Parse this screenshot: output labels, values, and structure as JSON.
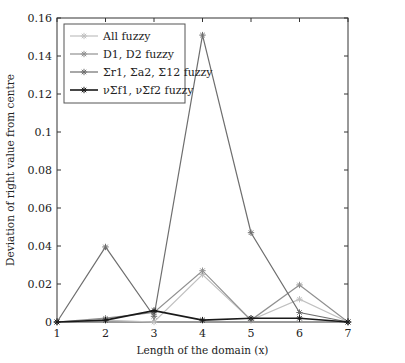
{
  "chart_data": {
    "type": "line",
    "title": "",
    "xlabel": "Length of the domain (x)",
    "ylabel": "Deviation of right value from centre",
    "x": [
      1,
      2,
      3,
      4,
      5,
      6,
      7
    ],
    "xlim": [
      1,
      7
    ],
    "ylim": [
      0,
      0.16
    ],
    "xticks": [
      "1",
      "2",
      "3",
      "4",
      "5",
      "6",
      "7"
    ],
    "yticks": [
      "0",
      "0.02",
      "0.04",
      "0.06",
      "0.08",
      "0.1",
      "0.12",
      "0.14",
      "0.16"
    ],
    "grid": false,
    "legend_position": "upper left",
    "series": [
      {
        "name": "All fuzzy",
        "color": "#c0c0c0",
        "values": [
          0,
          0.001,
          0.0,
          0.025,
          0.001,
          0.012,
          0.0
        ]
      },
      {
        "name": "D1, D2 fuzzy",
        "color": "#909090",
        "values": [
          0,
          0.002,
          0.005,
          0.027,
          0.001,
          0.0195,
          0.0
        ]
      },
      {
        "name": "Σr1, Σa2, Σ12 fuzzy",
        "color": "#6e6e6e",
        "values": [
          0,
          0.0395,
          0.003,
          0.151,
          0.047,
          0.005,
          0.0
        ]
      },
      {
        "name": "νΣf1, νΣf2 fuzzy",
        "color": "#1a1a1a",
        "values": [
          0,
          0.001,
          0.006,
          0.001,
          0.002,
          0.002,
          0.0
        ]
      }
    ]
  }
}
